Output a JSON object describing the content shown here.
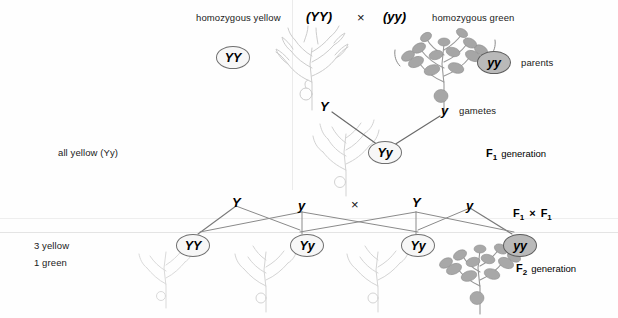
{
  "figure": {
    "title_top_row": {
      "left_label": "homozygous yellow",
      "left_genotype": "(YY)",
      "cross_symbol": "×",
      "right_genotype": "(yy)",
      "right_label": "homozygous green"
    },
    "parents": {
      "left_oval": "YY",
      "right_oval": "yy",
      "row_label": "parents"
    },
    "gametes": {
      "left": "Y",
      "right": "y",
      "row_label": "gametes"
    },
    "f1": {
      "left_label": "all yellow (Yy)",
      "oval": "Yy",
      "row_label_prefix": "F",
      "row_label_sub": "1",
      "row_label_word": "generation"
    },
    "f1_cross": {
      "gamete_far_left": "Y",
      "gamete_left": "y",
      "cross_symbol": "×",
      "gamete_right": "Y",
      "gamete_far_right": "y",
      "label_prefix_a": "F",
      "label_sub_a": "1",
      "label_cross": "×",
      "label_prefix_b": "F",
      "label_sub_b": "1"
    },
    "f2": {
      "ratio_line_1": "3 yellow",
      "ratio_line_2": "1 green",
      "ovals": [
        "YY",
        "Yy",
        "Yy",
        "yy"
      ],
      "row_label_prefix": "F",
      "row_label_sub": "2",
      "row_label_word": "generation"
    },
    "colors": {
      "oval_border": "#6f6f6f",
      "oval_fill": "#f7f7f7",
      "green_oval_fill": "#b9b9b9",
      "text": "#1a1a1a",
      "connector": "#6a6a6a",
      "plant_yellow": "#c9c9c9",
      "plant_green": "#8e8e8e",
      "background": "#fefefe"
    }
  }
}
